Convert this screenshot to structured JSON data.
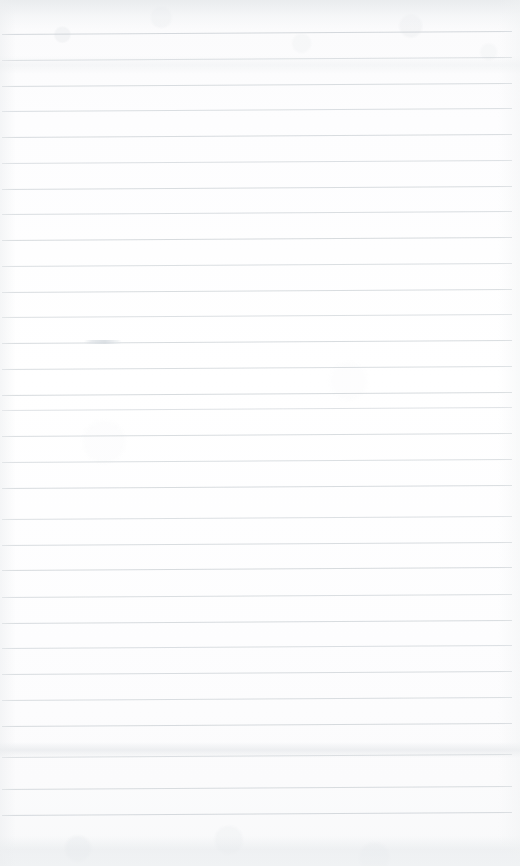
{
  "document": {
    "kind": "scanned-ruled-notebook-page",
    "title": "Blank ruled paper scan",
    "page_width": 520,
    "page_height": 866,
    "text_content": "",
    "has_legible_text": false,
    "orientation": "portrait"
  },
  "paper": {
    "background_color": "#fdfdfd",
    "top_tone_color": "#f7f8f9",
    "bottom_tone_color": "#f8f9fa",
    "texture": "mottled-scanner-noise"
  },
  "ruling": {
    "line_color": "#c9ced3",
    "line_color_faint": "#d8dde1",
    "line_thickness_px": 1,
    "line_spacing_px": 25.8,
    "first_line_y": 34,
    "last_line_y": 815,
    "line_count": 31,
    "line_start_x": 2,
    "line_end_x": 512,
    "skew_rise_px": 3,
    "skew_note": "lines rise slightly toward the right edge"
  },
  "lines": [
    {
      "id": 1,
      "y": 34,
      "opacity": 0.78
    },
    {
      "id": 2,
      "y": 60,
      "opacity": 0.62
    },
    {
      "id": 3,
      "y": 86,
      "opacity": 0.7
    },
    {
      "id": 4,
      "y": 111,
      "opacity": 0.66
    },
    {
      "id": 5,
      "y": 137,
      "opacity": 0.72
    },
    {
      "id": 6,
      "y": 163,
      "opacity": 0.64
    },
    {
      "id": 7,
      "y": 189,
      "opacity": 0.7
    },
    {
      "id": 8,
      "y": 214,
      "opacity": 0.68
    },
    {
      "id": 9,
      "y": 240,
      "opacity": 0.74
    },
    {
      "id": 10,
      "y": 266,
      "opacity": 0.66
    },
    {
      "id": 11,
      "y": 292,
      "opacity": 0.7
    },
    {
      "id": 12,
      "y": 317,
      "opacity": 0.64
    },
    {
      "id": 13,
      "y": 343,
      "opacity": 0.72
    },
    {
      "id": 14,
      "y": 369,
      "opacity": 0.68
    },
    {
      "id": 15,
      "y": 395,
      "opacity": 0.74
    },
    {
      "id": 16,
      "y": 410,
      "opacity": 0.6
    },
    {
      "id": 17,
      "y": 436,
      "opacity": 0.7
    },
    {
      "id": 18,
      "y": 462,
      "opacity": 0.66
    },
    {
      "id": 19,
      "y": 488,
      "opacity": 0.72
    },
    {
      "id": 20,
      "y": 519,
      "opacity": 0.64
    },
    {
      "id": 21,
      "y": 545,
      "opacity": 0.7
    },
    {
      "id": 22,
      "y": 570,
      "opacity": 0.74
    },
    {
      "id": 23,
      "y": 597,
      "opacity": 0.68
    },
    {
      "id": 24,
      "y": 623,
      "opacity": 0.72
    },
    {
      "id": 25,
      "y": 648,
      "opacity": 0.66
    },
    {
      "id": 26,
      "y": 674,
      "opacity": 0.7
    },
    {
      "id": 27,
      "y": 700,
      "opacity": 0.68
    },
    {
      "id": 28,
      "y": 726,
      "opacity": 0.74
    },
    {
      "id": 29,
      "y": 757,
      "opacity": 0.62
    },
    {
      "id": 30,
      "y": 789,
      "opacity": 0.7
    },
    {
      "id": 31,
      "y": 815,
      "opacity": 0.76
    }
  ],
  "marks": [
    {
      "name": "erased-pencil-mark",
      "x": 84,
      "y": 340,
      "width": 38,
      "height": 4,
      "description": "pale grey erased stroke, illegible"
    }
  ],
  "smudges": [
    {
      "name": "top-shadow-band",
      "y": 0,
      "height": 30
    },
    {
      "name": "upper-faint-band",
      "y": 56,
      "height": 18
    },
    {
      "name": "lower-grey-band",
      "y": 742,
      "height": 16
    },
    {
      "name": "bottom-noise-band",
      "y": 836,
      "height": 30
    }
  ]
}
